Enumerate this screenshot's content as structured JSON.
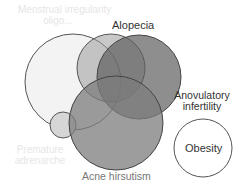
{
  "diagram": {
    "type": "euler",
    "sets": [
      {
        "id": "top-left",
        "label_line1": "Menstrual irregularity",
        "label_line2": "oligo...",
        "fill": "#f4f4f4",
        "opacity": 1
      },
      {
        "id": "alopecia",
        "label": "Alopecia",
        "fill": "#bdbdbd",
        "opacity": 0.65
      },
      {
        "id": "anovulatory",
        "label_line1": "Anovulatory",
        "label_line2": "infertility",
        "fill": "#6f6f6f",
        "opacity": 0.7
      },
      {
        "id": "acne-hirsutism",
        "label": "Acne hirsutism",
        "fill": "#8e8e8e",
        "opacity": 0.75
      },
      {
        "id": "premature-adrenarche",
        "label_line1": "Premature",
        "label_line2": "adrenarche",
        "fill": "#d8d8d8",
        "opacity": 1
      },
      {
        "id": "obesity",
        "label": "Obesity",
        "fill": "#ffffff",
        "opacity": 1
      }
    ],
    "stroke": "#555555"
  }
}
